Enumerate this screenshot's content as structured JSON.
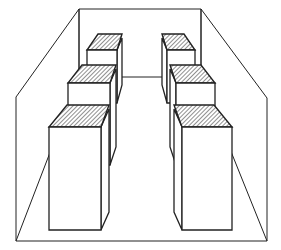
{
  "diagram": {
    "stroke_color": "#222222",
    "background_color": "#ffffff",
    "hatch_color": "#333333",
    "room": {
      "left_wall": [
        [
          16,
          97
        ],
        [
          79,
          9
        ],
        [
          79,
          77
        ],
        [
          16,
          241
        ]
      ],
      "back_wall": [
        [
          79,
          9
        ],
        [
          201,
          9
        ],
        [
          201,
          77
        ],
        [
          79,
          77
        ]
      ],
      "right_wall": [
        [
          201,
          9
        ],
        [
          267,
          98
        ],
        [
          267,
          241
        ],
        [
          201,
          77
        ]
      ],
      "floor_line": [
        [
          16,
          241
        ],
        [
          267,
          241
        ]
      ]
    },
    "cabinets": [
      {
        "id": "left-back",
        "row": "left",
        "position": "back",
        "front": [
          87,
          50,
          117,
          103
        ],
        "top_skew": [
          -6,
          -16
        ],
        "side_depth": 5
      },
      {
        "id": "left-middle",
        "row": "left",
        "position": "middle",
        "front": [
          68,
          83,
          110,
          165
        ],
        "top_skew": [
          -8,
          -18
        ],
        "side_depth": 6
      },
      {
        "id": "left-front",
        "row": "left",
        "position": "front",
        "front": [
          49,
          127,
          101,
          230
        ],
        "top_skew": [
          -10,
          -22
        ],
        "side_depth": 8
      },
      {
        "id": "right-back",
        "row": "right",
        "position": "back",
        "front": [
          167,
          50,
          195,
          103
        ],
        "top_skew": [
          6,
          -16
        ],
        "side_depth": 5
      },
      {
        "id": "right-middle",
        "row": "right",
        "position": "middle",
        "front": [
          176,
          83,
          215,
          165
        ],
        "top_skew": [
          8,
          -18
        ],
        "side_depth": 6
      },
      {
        "id": "right-front",
        "row": "right",
        "position": "front",
        "front": [
          182,
          127,
          232,
          230
        ],
        "top_skew": [
          10,
          -22
        ],
        "side_depth": 8
      }
    ]
  }
}
